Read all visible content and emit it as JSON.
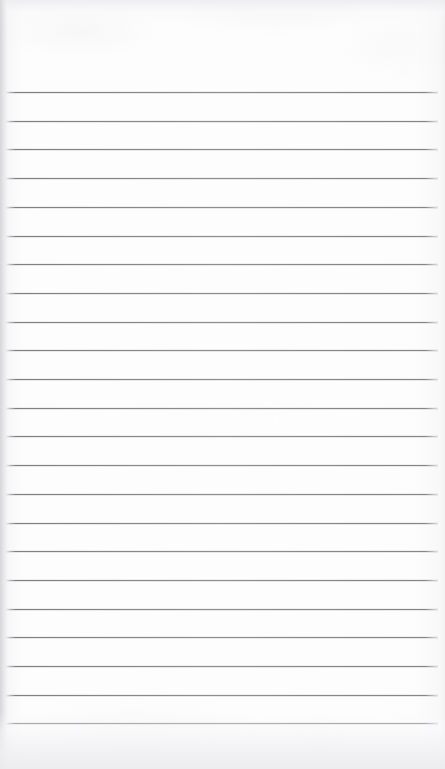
{
  "document": {
    "kind": "scanned-ruled-notepad-page",
    "title": "Blank Ruled Notepad Page",
    "content_text": "",
    "has_handwriting": false,
    "has_printed_text": false,
    "orientation": "portrait"
  },
  "canvas": {
    "width": 445,
    "height": 769,
    "background_color": "#ffffff"
  },
  "paper": {
    "color": "#fdfdfd",
    "tone_description": "near-white scanned paper",
    "top_margin_px": 92,
    "bottom_margin_px": 46
  },
  "ruling": {
    "line_color": "#86868a",
    "line_thickness_px": 1,
    "line_count": 23,
    "line_spacing_px": 28.7,
    "first_line_y": 92,
    "last_line_y": 723,
    "line_start_x": 6,
    "line_end_x": 438,
    "line_positions_y": [
      92,
      120.7,
      149.4,
      178.1,
      206.8,
      235.5,
      264.2,
      292.9,
      321.6,
      350.3,
      379.0,
      407.7,
      436.4,
      465.1,
      493.8,
      522.5,
      551.2,
      579.9,
      608.6,
      637.3,
      666.0,
      694.7,
      723.4
    ]
  },
  "scan_artifacts": {
    "left_edge_shadow_color": "#d6d6d9",
    "left_edge_shadow_width_px": 10,
    "top_edge_shade_color": "#ececee",
    "top_edge_shade_height_px": 26,
    "bottom_shade_color": "#ecece f",
    "bottom_shade_height_px": 58,
    "right_edge_shade_color": "#eeeef0",
    "grain_opacity": 0.4
  },
  "labels": {
    "page_region": "notepad-page",
    "header_region": "blank-header-margin",
    "body_region": "ruled-writing-area",
    "footer_region": "blank-bottom-margin"
  }
}
